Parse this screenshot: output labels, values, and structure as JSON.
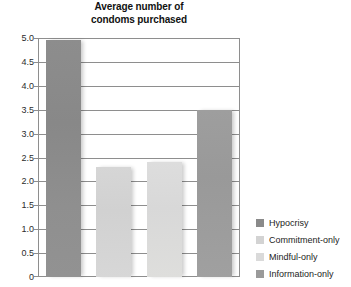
{
  "chart_data": {
    "type": "bar",
    "title": "Average number of condoms purchased",
    "title_lines": [
      "Average number of",
      "condoms purchased"
    ],
    "xlabel": "",
    "ylabel": "",
    "ylim": [
      0,
      5.0
    ],
    "grid": true,
    "legend_position": "right-bottom",
    "categories": [
      "Hypocrisy",
      "Commitment-only",
      "Mindful-only",
      "Information-only"
    ],
    "values": [
      4.95,
      2.3,
      2.4,
      3.5
    ],
    "ytick_labels": [
      "5.0",
      "4.5",
      "4.0",
      "3.5",
      "3.0",
      "2.5",
      "2.0",
      "1.5",
      "1.0",
      "0.5",
      "0"
    ],
    "ytick_values": [
      5.0,
      4.5,
      4.0,
      3.5,
      3.0,
      2.5,
      2.0,
      1.5,
      1.0,
      0.5,
      0
    ],
    "bar_colors": [
      "#8a8a8a",
      "#d3d3d3",
      "#dadada",
      "#9a9a9a"
    ],
    "axis_color": "#8e8e8e",
    "plot_background": "#ffffff"
  },
  "legend": {
    "items": [
      {
        "label": "Hypocrisy",
        "color": "#8a8a8a"
      },
      {
        "label": "Commitment-only",
        "color": "#d3d3d3"
      },
      {
        "label": "Mindful-only",
        "color": "#dadada"
      },
      {
        "label": "Information-only",
        "color": "#9a9a9a"
      }
    ]
  }
}
